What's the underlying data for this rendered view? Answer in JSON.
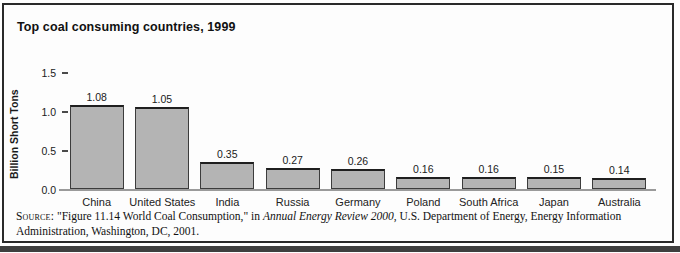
{
  "figure": {
    "title": "Top coal consuming countries, 1999",
    "source": {
      "label": "Source:",
      "part1": " \"Figure 11.14 World Coal Consumption,\" in ",
      "italic_title": "Annual Energy Review 2000",
      "part2": ", U.S. Department of Energy, Energy Information Administration, Washington, DC, 2001."
    }
  },
  "chart_data": {
    "type": "bar",
    "title": "Top coal consuming countries, 1999",
    "categories": [
      "China",
      "United States",
      "India",
      "Russia",
      "Germany",
      "Poland",
      "South Africa",
      "Japan",
      "Australia"
    ],
    "values": [
      1.08,
      1.05,
      0.35,
      0.27,
      0.26,
      0.16,
      0.16,
      0.15,
      0.14
    ],
    "value_labels": [
      "1.08",
      "1.05",
      "0.35",
      "0.27",
      "0.26",
      "0.16",
      "0.16",
      "0.15",
      "0.14"
    ],
    "xlabel": "",
    "ylabel": "Billion Short Tons",
    "ylim": [
      0,
      1.5
    ],
    "yticks": [
      0.0,
      0.5,
      1.0,
      1.5
    ],
    "ytick_labels": [
      "0.0",
      "0.5",
      "1.0",
      "1.5"
    ],
    "grid": false,
    "legend": false,
    "bar_fill_color": "#b4b4b4",
    "bar_border_color": "#3c3c3c",
    "baseline_color": "#9a9a9a"
  }
}
